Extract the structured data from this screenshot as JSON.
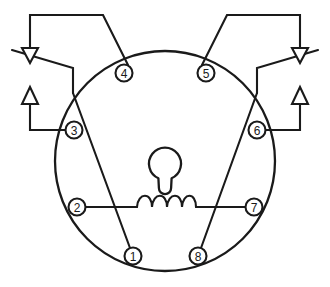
{
  "diagram": {
    "type": "electrical-schematic",
    "colors": {
      "line": "#1a1a1a",
      "background": "#ffffff",
      "fill": "#ffffff"
    },
    "socket": {
      "shape": "circle",
      "center_x": 165,
      "center_y": 161,
      "radius": 110
    },
    "keyway": {
      "name": "orientation-key",
      "circle_center_x": 165,
      "circle_center_y": 165,
      "circle_radius": 16,
      "tab_width": 11,
      "tab_height": 22
    },
    "coil": {
      "name": "relay-coil",
      "humps": 4,
      "start_x": 137,
      "end_x": 196,
      "y": 207,
      "between_pins": [
        "2",
        "7"
      ]
    },
    "terminals": [
      {
        "id": "1",
        "label": "1",
        "cx": 133,
        "cy": 256
      },
      {
        "id": "2",
        "label": "2",
        "cx": 77,
        "cy": 207
      },
      {
        "id": "3",
        "label": "3",
        "cx": 74,
        "cy": 130
      },
      {
        "id": "4",
        "label": "4",
        "cx": 124,
        "cy": 73
      },
      {
        "id": "5",
        "label": "5",
        "cx": 206,
        "cy": 73
      },
      {
        "id": "6",
        "label": "6",
        "cx": 257,
        "cy": 130
      },
      {
        "id": "7",
        "label": "7",
        "cx": 254,
        "cy": 207
      },
      {
        "id": "8",
        "label": "8",
        "cx": 198,
        "cy": 256
      }
    ],
    "terminal_radius": 8.5,
    "connections": [
      {
        "name": "pin-4-to-pin-1",
        "from": "4",
        "to": "1",
        "style": "diagonal"
      },
      {
        "name": "pin-5-to-pin-8",
        "from": "5",
        "to": "8",
        "style": "diagonal"
      },
      {
        "name": "pin-2-to-pin-7",
        "from": "2",
        "to": "7",
        "style": "coil"
      }
    ],
    "leads": [
      {
        "name": "lead-pin-4-to-left-down-arrow",
        "pin": "4",
        "arrow": "down-arrow-left",
        "path": "M 124 65 L 103 22 L 30 22 L 30 48"
      },
      {
        "name": "lead-pin-3-to-left-up-arrow",
        "pin": "3",
        "arrow": "up-arrow-left",
        "path": "M 66 130 L 30 130 L 30 104"
      },
      {
        "name": "lead-external-left-down",
        "name_alt": "external-line-left-upper",
        "path": "M 12 50 L 73 68 L 73 93 L 121 260"
      },
      {
        "name": "lead-pin-5-to-right-down-arrow",
        "pin": "5",
        "arrow": "down-arrow-right",
        "path": "M 206 65 L 227 22 L 300 22 L 300 48"
      },
      {
        "name": "lead-pin-6-to-right-up-arrow",
        "pin": "6",
        "arrow": "up-arrow-right",
        "path": "M 265 130 L 300 130 L 300 104"
      },
      {
        "name": "external-line-right-upper",
        "path": "M 318 50 L 257 68 L 257 93 L 209 260"
      }
    ],
    "arrows": [
      {
        "name": "down-arrow-left",
        "direction": "down",
        "x": 30,
        "tip_y": 62,
        "width": 16,
        "height": 16
      },
      {
        "name": "up-arrow-left",
        "direction": "up",
        "x": 30,
        "tip_y": 88,
        "width": 16,
        "height": 16
      },
      {
        "name": "down-arrow-right",
        "direction": "down",
        "x": 300,
        "tip_y": 62,
        "width": 16,
        "height": 16
      },
      {
        "name": "up-arrow-right",
        "direction": "up",
        "x": 300,
        "tip_y": 88,
        "width": 16,
        "height": 16
      }
    ]
  }
}
